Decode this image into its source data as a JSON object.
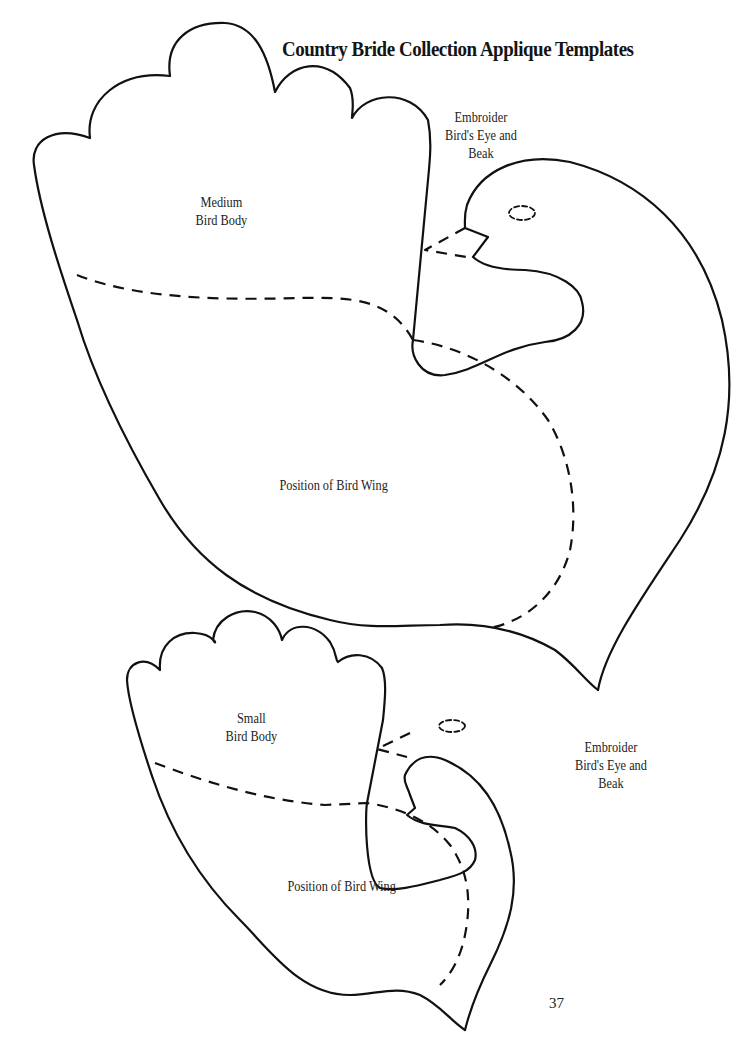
{
  "page": {
    "title": "Country Bride Collection Applique Templates",
    "page_number": "37"
  },
  "medium_bird": {
    "body_label": [
      "Medium",
      "Bird Body"
    ],
    "instruction_label": [
      "Embroider",
      "Bird's Eye and",
      "Beak"
    ],
    "wing_label": "Position of Bird Wing"
  },
  "small_bird": {
    "body_label": [
      "Small",
      "Bird Body"
    ],
    "instruction_label": [
      "Embroider",
      "Bird's Eye and",
      "Beak"
    ],
    "wing_label": "Position of Bird Wing"
  },
  "line_styles": {
    "cut_line": "solid",
    "placement_line": "dashed",
    "stroke_color": "#111111"
  }
}
